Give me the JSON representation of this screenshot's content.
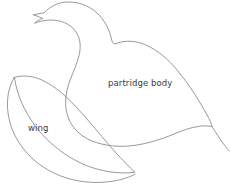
{
  "document": {
    "title": "Partridge Pattern Template",
    "background_color": "#ffffff",
    "width": 230,
    "height": 194
  },
  "style": {
    "outline_color": "#8d8d8d",
    "outline_width": 0.9,
    "label_color": "#3a3a3a",
    "label_font_size": "8.5px"
  },
  "pieces": [
    {
      "id": "body",
      "label": "partridge body",
      "icon": "bird-body-outline-icon",
      "label_position": {
        "x": 108,
        "y": 79
      }
    },
    {
      "id": "wing",
      "label": "wing",
      "icon": "bird-wing-outline-icon",
      "label_position": {
        "x": 28,
        "y": 124
      }
    }
  ],
  "paths": {
    "body": "M 33.5 14.8 L 44.5 12.6 C 49.5 7.2 56.5 3.0 64.5 2.2 C 76.0 1.0 88.0 4.6 97.0 13.0 C 104.5 20.0 109.5 29.5 111.8 40.2 C 112.6 43.6 113.8 44.4 117.0 43.2 C 126.0 40.0 136.5 40.8 145.5 44.8 C 158.0 50.3 168.5 59.6 177.5 70.5 C 189.5 85.0 199.5 101.0 208.5 117.5 C 210.0 120.3 211.2 123.4 212.2 126.6 C 208.0 125.8 203.8 125.6 199.6 126.2 C 190.0 127.5 181.0 131.0 172.0 134.8 C 160.0 139.8 147.5 143.6 134.5 145.4 C 120.0 147.4 105.0 146.2 91.5 140.8 C 84.5 138.0 78.5 133.6 74.0 127.8 C 68.5 120.8 65.8 112.2 65.6 103.4 C 65.4 95.0 67.5 86.8 70.5 79.0 C 73.5 71.2 77.0 63.6 79.0 55.6 C 80.5 49.4 80.8 42.8 78.5 36.8 C 76.4 31.2 72.2 26.6 67.0 23.8 C 61.0 20.6 54.0 19.6 47.4 20.2 C 43.0 20.6 38.6 21.6 34.5 23.2 C 36.8 21.0 39.8 19.5 42.8 18.4 C 39.8 17.0 36.6 16.0 33.5 14.8 Z",
    "body_tail": "M 212.2 126.6 C 216.0 133.0 220.0 139.4 224.5 145.2 C 226.0 147.2 227.6 149.2 229.4 151.0",
    "wing": "M 14.2 77.4 C 24.0 74.6 34.5 76.2 43.5 80.8 C 56.0 87.0 66.5 96.6 76.0 106.8 C 88.0 119.6 99.0 133.4 110.5 146.6 C 117.0 154.0 123.5 161.4 130.6 168.2 C 132.0 169.6 133.5 170.9 135.0 172.2 C 131.0 172.8 127.0 173.0 123.0 172.9 C 110.0 172.6 97.2 170.0 85.2 165.0 C 71.0 159.0 58.0 150.2 47.0 139.4 C 36.5 129.0 28.0 116.8 22.0 103.4 C 18.4 95.4 15.8 86.9 14.6 78.2 Z",
    "wing_inner": "M 14.2 77.4 C 11.4 82.4 9.4 87.8 8.4 93.4 C 6.4 104.6 7.6 116.2 11.4 127.0 C 16.0 140.2 24.4 151.8 35.0 160.8 C 47.0 171.0 61.6 177.6 77.0 180.6 C 92.0 183.5 107.6 183.0 122.2 179.2 C 126.6 178.0 131.0 176.4 135.0 174.2"
  }
}
